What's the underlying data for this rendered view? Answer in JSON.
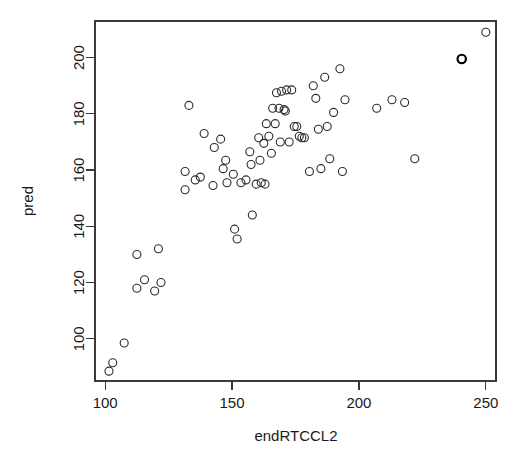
{
  "chart_data": {
    "type": "scatter",
    "title": "",
    "xlabel": "endRTCCL2",
    "ylabel": "pred",
    "xlim": [
      96,
      254
    ],
    "ylim": [
      85,
      213
    ],
    "xticks": [
      100,
      150,
      200,
      250
    ],
    "yticks": [
      100,
      120,
      140,
      160,
      180,
      200
    ],
    "xtick_labels": [
      "100",
      "150",
      "200",
      "250"
    ],
    "ytick_labels": [
      "100",
      "120",
      "140",
      "160",
      "180",
      "200"
    ],
    "grid": false,
    "legend": null,
    "marker": "open-circle",
    "marker_color": "#2b2b2b",
    "n_points": 71,
    "points": [
      {
        "x": 101.5,
        "y": 88.5
      },
      {
        "x": 103.0,
        "y": 91.5
      },
      {
        "x": 107.5,
        "y": 98.5
      },
      {
        "x": 112.5,
        "y": 118.0
      },
      {
        "x": 115.5,
        "y": 121.0
      },
      {
        "x": 119.5,
        "y": 117.0
      },
      {
        "x": 122.0,
        "y": 120.0
      },
      {
        "x": 112.5,
        "y": 130.0
      },
      {
        "x": 121.0,
        "y": 132.0
      },
      {
        "x": 131.5,
        "y": 159.5
      },
      {
        "x": 131.5,
        "y": 153.0
      },
      {
        "x": 133.0,
        "y": 183.0
      },
      {
        "x": 135.5,
        "y": 156.5
      },
      {
        "x": 137.5,
        "y": 157.5
      },
      {
        "x": 139.0,
        "y": 173.0
      },
      {
        "x": 142.5,
        "y": 154.5
      },
      {
        "x": 143.0,
        "y": 168.0
      },
      {
        "x": 145.5,
        "y": 171.0
      },
      {
        "x": 146.5,
        "y": 160.5
      },
      {
        "x": 147.5,
        "y": 163.5
      },
      {
        "x": 148.0,
        "y": 155.5
      },
      {
        "x": 150.5,
        "y": 158.5
      },
      {
        "x": 151.0,
        "y": 139.0
      },
      {
        "x": 152.0,
        "y": 135.5
      },
      {
        "x": 153.5,
        "y": 155.5
      },
      {
        "x": 155.5,
        "y": 156.5
      },
      {
        "x": 157.0,
        "y": 166.5
      },
      {
        "x": 157.5,
        "y": 162.0
      },
      {
        "x": 158.0,
        "y": 144.0
      },
      {
        "x": 159.5,
        "y": 155.0
      },
      {
        "x": 160.5,
        "y": 171.5
      },
      {
        "x": 161.0,
        "y": 163.5
      },
      {
        "x": 161.5,
        "y": 155.5
      },
      {
        "x": 162.5,
        "y": 169.5
      },
      {
        "x": 163.0,
        "y": 155.0
      },
      {
        "x": 163.5,
        "y": 176.5
      },
      {
        "x": 164.5,
        "y": 172.0
      },
      {
        "x": 165.5,
        "y": 166.0
      },
      {
        "x": 166.0,
        "y": 182.0
      },
      {
        "x": 167.0,
        "y": 176.5
      },
      {
        "x": 167.5,
        "y": 187.5
      },
      {
        "x": 168.5,
        "y": 182.0
      },
      {
        "x": 169.0,
        "y": 170.0
      },
      {
        "x": 169.5,
        "y": 188.0
      },
      {
        "x": 170.5,
        "y": 181.5
      },
      {
        "x": 171.0,
        "y": 181.0
      },
      {
        "x": 171.5,
        "y": 188.5
      },
      {
        "x": 172.5,
        "y": 170.0
      },
      {
        "x": 173.5,
        "y": 188.5
      },
      {
        "x": 174.5,
        "y": 175.5
      },
      {
        "x": 175.5,
        "y": 175.5
      },
      {
        "x": 176.5,
        "y": 172.0
      },
      {
        "x": 177.5,
        "y": 171.5
      },
      {
        "x": 178.5,
        "y": 171.5
      },
      {
        "x": 180.5,
        "y": 159.5
      },
      {
        "x": 182.0,
        "y": 190.0
      },
      {
        "x": 183.0,
        "y": 185.5
      },
      {
        "x": 184.0,
        "y": 174.5
      },
      {
        "x": 185.0,
        "y": 160.5
      },
      {
        "x": 186.5,
        "y": 193.0
      },
      {
        "x": 187.5,
        "y": 175.5
      },
      {
        "x": 188.5,
        "y": 164.0
      },
      {
        "x": 190.0,
        "y": 180.5
      },
      {
        "x": 192.5,
        "y": 196.0
      },
      {
        "x": 193.5,
        "y": 159.5
      },
      {
        "x": 194.5,
        "y": 185.0
      },
      {
        "x": 207.0,
        "y": 182.0
      },
      {
        "x": 213.0,
        "y": 185.0
      },
      {
        "x": 218.0,
        "y": 184.0
      },
      {
        "x": 222.0,
        "y": 164.0
      },
      {
        "x": 240.5,
        "y": 199.5,
        "emphasis": true
      },
      {
        "x": 250.0,
        "y": 209.0
      }
    ]
  },
  "plot_box": {
    "left": 95,
    "top": 21,
    "right": 496,
    "bottom": 381
  }
}
